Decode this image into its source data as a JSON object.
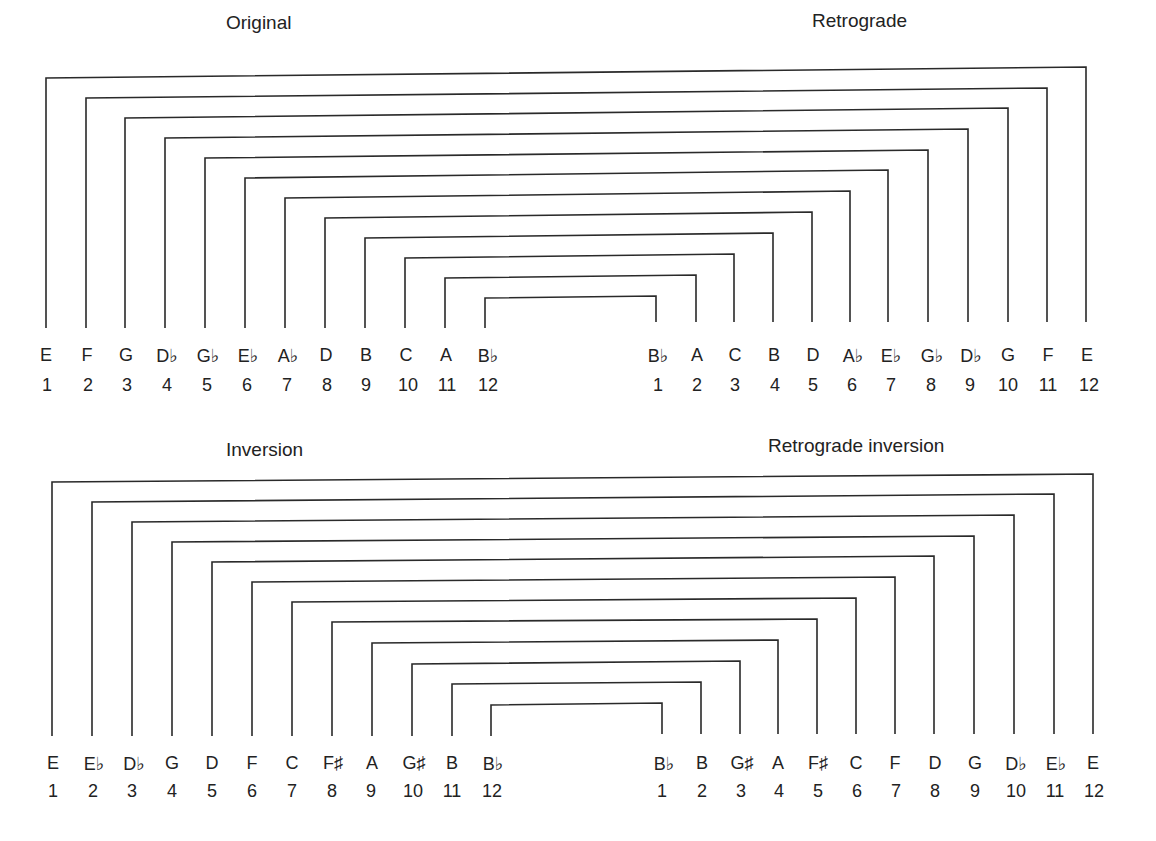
{
  "titles": {
    "original": "Original",
    "retrograde": "Retrograde",
    "inversion": "Inversion",
    "retrograde_inversion": "Retrograde inversion"
  },
  "rows": {
    "original": {
      "notes": [
        "E",
        "F",
        "G",
        "D♭",
        "G♭",
        "E♭",
        "A♭",
        "D",
        "B",
        "C",
        "A",
        "B♭"
      ],
      "numbers": [
        "1",
        "2",
        "3",
        "4",
        "5",
        "6",
        "7",
        "8",
        "9",
        "10",
        "11",
        "12"
      ]
    },
    "retrograde": {
      "notes": [
        "B♭",
        "A",
        "C",
        "B",
        "D",
        "A♭",
        "E♭",
        "G♭",
        "D♭",
        "G",
        "F",
        "E"
      ],
      "numbers": [
        "1",
        "2",
        "3",
        "4",
        "5",
        "6",
        "7",
        "8",
        "9",
        "10",
        "11",
        "12"
      ]
    },
    "inversion": {
      "notes": [
        "E",
        "E♭",
        "D♭",
        "G",
        "D",
        "F",
        "C",
        "F♯",
        "A",
        "G♯",
        "B",
        "B♭"
      ],
      "numbers": [
        "1",
        "2",
        "3",
        "4",
        "5",
        "6",
        "7",
        "8",
        "9",
        "10",
        "11",
        "12"
      ]
    },
    "retrograde_inversion": {
      "notes": [
        "B♭",
        "B",
        "G♯",
        "A",
        "F♯",
        "C",
        "F",
        "D",
        "G",
        "D♭",
        "E♭",
        "E"
      ],
      "numbers": [
        "1",
        "2",
        "3",
        "4",
        "5",
        "6",
        "7",
        "8",
        "9",
        "10",
        "11",
        "12"
      ]
    }
  },
  "colors": {
    "line": "#2a2a2a",
    "text": "#222222",
    "background": "#ffffff"
  }
}
